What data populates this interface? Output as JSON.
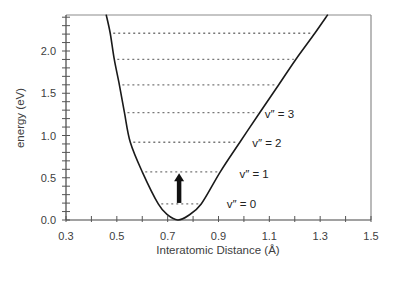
{
  "chart_data": {
    "type": "line",
    "title": "",
    "xlabel": "Interatomic Distance (Å)",
    "ylabel": "energy (eV)",
    "xlim": [
      0.3,
      1.5
    ],
    "ylim": [
      0.0,
      2.43
    ],
    "x_ticks": [
      "0.3",
      "0.5",
      "0.7",
      "0.9",
      "1.1",
      "1.3",
      "1.5"
    ],
    "y_ticks": [
      "0.0",
      "0.5",
      "1.0",
      "1.5",
      "2.0"
    ],
    "x_minor_step": 0.1,
    "y_minor_step": 0.1,
    "grid": false,
    "legend": null,
    "series": [
      {
        "name": "potential energy curve",
        "style": "solid",
        "x": [
          0.458,
          0.474,
          0.49,
          0.51,
          0.53,
          0.553,
          0.6,
          0.663,
          0.7,
          0.74,
          0.78,
          0.832,
          0.907,
          0.984,
          1.062,
          1.137,
          1.204,
          1.279,
          1.33
        ],
        "y": [
          2.43,
          2.21,
          1.9,
          1.6,
          1.27,
          0.92,
          0.57,
          0.19,
          0.06,
          0.0,
          0.05,
          0.19,
          0.57,
          0.92,
          1.27,
          1.6,
          1.9,
          2.21,
          2.43
        ]
      }
    ],
    "energy_levels": [
      {
        "energy": 0.19,
        "x_left": 0.663,
        "x_right": 0.832
      },
      {
        "energy": 0.57,
        "x_left": 0.6,
        "x_right": 0.907
      },
      {
        "energy": 0.92,
        "x_left": 0.553,
        "x_right": 0.984
      },
      {
        "energy": 1.27,
        "x_left": 0.53,
        "x_right": 1.062
      },
      {
        "energy": 1.6,
        "x_left": 0.51,
        "x_right": 1.137
      },
      {
        "energy": 1.9,
        "x_left": 0.49,
        "x_right": 1.204
      },
      {
        "energy": 2.21,
        "x_left": 0.474,
        "x_right": 1.279
      }
    ],
    "annotations": [
      {
        "text": "v″ = 0",
        "x": 0.99,
        "y": 0.19
      },
      {
        "text": "v″ = 1",
        "x": 1.04,
        "y": 0.55
      },
      {
        "text": "v″ = 2",
        "x": 1.09,
        "y": 0.91
      },
      {
        "text": "v″ = 3",
        "x": 1.14,
        "y": 1.25
      }
    ],
    "arrow": {
      "x": 0.745,
      "y_start": 0.19,
      "y_end": 0.54,
      "direction": "up"
    }
  }
}
